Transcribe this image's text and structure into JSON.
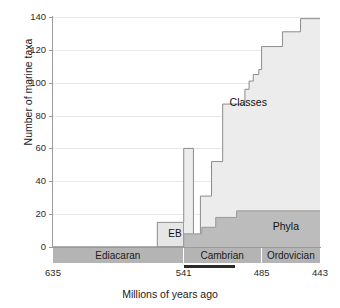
{
  "chart_data": {
    "type": "area",
    "title": "",
    "xlabel": "Millions of years ago",
    "ylabel": "Number of marine taxa",
    "xlim": [
      635,
      443
    ],
    "ylim": [
      0,
      140
    ],
    "x_reversed": true,
    "xticks": [
      635,
      541,
      485,
      443
    ],
    "yticks": [
      0,
      20,
      40,
      60,
      80,
      100,
      120,
      140
    ],
    "grid": "horizontal",
    "legend_position": "inline-annotations",
    "series": [
      {
        "name": "Classes",
        "type": "step-area",
        "fill_color": "#ececec",
        "line_color": "#8c8c8c",
        "points": [
          {
            "x": 635,
            "y": 0
          },
          {
            "x": 560,
            "y": 0
          },
          {
            "x": 560,
            "y": 15
          },
          {
            "x": 541,
            "y": 15
          },
          {
            "x": 541,
            "y": 60
          },
          {
            "x": 534,
            "y": 60
          },
          {
            "x": 534,
            "y": 4
          },
          {
            "x": 529,
            "y": 4
          },
          {
            "x": 529,
            "y": 31
          },
          {
            "x": 521,
            "y": 31
          },
          {
            "x": 521,
            "y": 52
          },
          {
            "x": 513,
            "y": 52
          },
          {
            "x": 513,
            "y": 87
          },
          {
            "x": 497,
            "y": 87
          },
          {
            "x": 497,
            "y": 96
          },
          {
            "x": 494,
            "y": 96
          },
          {
            "x": 494,
            "y": 101
          },
          {
            "x": 491,
            "y": 101
          },
          {
            "x": 491,
            "y": 105
          },
          {
            "x": 487,
            "y": 105
          },
          {
            "x": 487,
            "y": 108
          },
          {
            "x": 485,
            "y": 108
          },
          {
            "x": 485,
            "y": 122
          },
          {
            "x": 470,
            "y": 122
          },
          {
            "x": 470,
            "y": 131
          },
          {
            "x": 457,
            "y": 131
          },
          {
            "x": 457,
            "y": 139
          },
          {
            "x": 443,
            "y": 139
          }
        ]
      },
      {
        "name": "Phyla",
        "type": "step-area",
        "fill_color": "#bcbcbc",
        "line_color": "#9a9a9a",
        "points": [
          {
            "x": 635,
            "y": 0
          },
          {
            "x": 541,
            "y": 0
          },
          {
            "x": 541,
            "y": 8
          },
          {
            "x": 528,
            "y": 8
          },
          {
            "x": 528,
            "y": 12
          },
          {
            "x": 518,
            "y": 12
          },
          {
            "x": 518,
            "y": 18
          },
          {
            "x": 503,
            "y": 18
          },
          {
            "x": 503,
            "y": 22
          },
          {
            "x": 443,
            "y": 22
          }
        ]
      }
    ],
    "annotations": [
      {
        "name": "classes-label",
        "text": "Classes",
        "x": 508,
        "y": 88
      },
      {
        "name": "phyla-label",
        "text": "Phyla",
        "x": 477,
        "y": 13
      },
      {
        "name": "eb-box-label",
        "text": "EB",
        "x": 552,
        "y": 8,
        "note": "Ediacaran biota box, height 15 taxa"
      }
    ]
  },
  "axes": {
    "y": {
      "label": "Number of marine taxa",
      "ticks": [
        "0",
        "20",
        "40",
        "60",
        "80",
        "100",
        "120",
        "140"
      ]
    },
    "x": {
      "label": "Millions of years ago",
      "ticks": [
        "635",
        "541",
        "485",
        "443"
      ]
    }
  },
  "periods": [
    {
      "name": "Ediacaran",
      "start": 635,
      "end": 541
    },
    {
      "name": "Cambrian",
      "start": 541,
      "end": 485
    },
    {
      "name": "Ordovician",
      "start": 485,
      "end": 443
    }
  ],
  "markers": {
    "cambrian_explosion_bar": {
      "name": "cambrian-explosion-bar",
      "start": 541,
      "end": 504,
      "color": "#2a2a2a"
    }
  },
  "colors": {
    "classes_fill": "#ececec",
    "classes_line": "#8c8c8c",
    "phyla_fill": "#bcbcbc",
    "phyla_line": "#9a9a9a",
    "period_band": "#b4b4b4",
    "gridline": "#e9e9e9",
    "axis": "#9a9a9a",
    "text": "#1a1a1a"
  }
}
